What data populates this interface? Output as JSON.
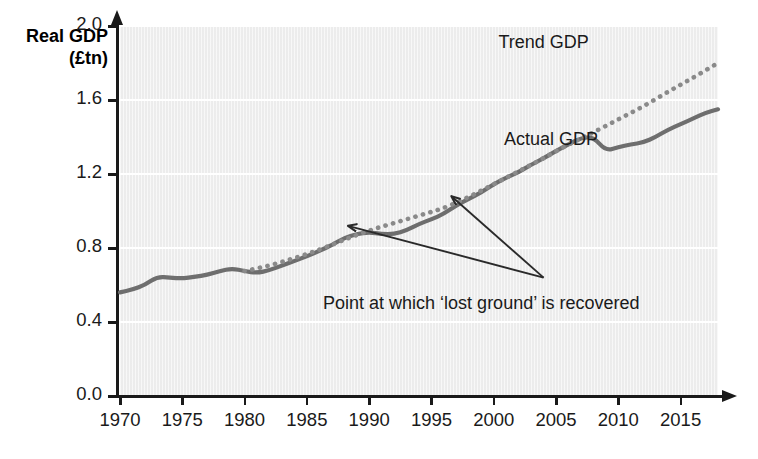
{
  "chart_data": {
    "type": "line",
    "title": "",
    "xlabel": "",
    "ylabel": "Real GDP\n(£tn)",
    "ylabel_line1": "Real GDP",
    "ylabel_line2": "(£tn)",
    "xlim": [
      1970,
      2018
    ],
    "ylim": [
      0.0,
      2.0
    ],
    "grid": true,
    "legend_position": "inline-annotation",
    "yticks": [
      "0.0",
      "0.4",
      "0.8",
      "1.2",
      "1.6",
      "2.0"
    ],
    "ytick_values": [
      0.0,
      0.4,
      0.8,
      1.2,
      1.6,
      2.0
    ],
    "xticks": [
      "1970",
      "1975",
      "1980",
      "1985",
      "1990",
      "1995",
      "2000",
      "2005",
      "2010",
      "2015"
    ],
    "xtick_values": [
      1970,
      1975,
      1980,
      1985,
      1990,
      1995,
      2000,
      2005,
      2010,
      2015
    ],
    "series": [
      {
        "name": "Actual GDP",
        "style": "solid",
        "color": "#6e6e6e",
        "x": [
          1970,
          1971,
          1972,
          1973,
          1974,
          1975,
          1976,
          1977,
          1978,
          1979,
          1980,
          1981,
          1982,
          1983,
          1984,
          1985,
          1986,
          1987,
          1988,
          1989,
          1990,
          1991,
          1992,
          1993,
          1994,
          1995,
          1996,
          1997,
          1998,
          1999,
          2000,
          2001,
          2002,
          2003,
          2004,
          2005,
          2006,
          2007,
          2008,
          2009,
          2010,
          2011,
          2012,
          2013,
          2014,
          2015,
          2016,
          2017,
          2018
        ],
        "values": [
          0.56,
          0.575,
          0.6,
          0.645,
          0.64,
          0.635,
          0.645,
          0.655,
          0.675,
          0.69,
          0.675,
          0.665,
          0.68,
          0.705,
          0.73,
          0.755,
          0.785,
          0.815,
          0.855,
          0.875,
          0.885,
          0.875,
          0.875,
          0.895,
          0.93,
          0.955,
          0.985,
          1.03,
          1.065,
          1.1,
          1.145,
          1.18,
          1.21,
          1.25,
          1.285,
          1.325,
          1.36,
          1.395,
          1.4,
          1.325,
          1.345,
          1.36,
          1.37,
          1.4,
          1.44,
          1.47,
          1.5,
          1.53,
          1.55
        ]
      },
      {
        "name": "Trend GDP",
        "style": "dotted",
        "color": "#8a8a8a",
        "x": [
          1980,
          1982,
          1984,
          1986,
          1988,
          1990,
          1992,
          1994,
          1996,
          1998,
          2000,
          2002,
          2004,
          2006,
          2008,
          2010,
          2012,
          2014,
          2016,
          2018
        ],
        "values": [
          0.675,
          0.705,
          0.745,
          0.79,
          0.845,
          0.895,
          0.935,
          0.975,
          1.015,
          1.075,
          1.145,
          1.215,
          1.285,
          1.36,
          1.425,
          1.495,
          1.565,
          1.645,
          1.72,
          1.8
        ]
      }
    ],
    "annotations": [
      {
        "name": "trend-gdp-label",
        "text": "Trend GDP",
        "x": 2004.0,
        "y": 1.905
      },
      {
        "name": "actual-gdp-label",
        "text": "Actual GDP",
        "x": 2004.6,
        "y": 1.38
      },
      {
        "name": "recovery-note",
        "text": "Point at which ‘lost ground’ is recovered",
        "x": 1999.0,
        "y": 0.49
      }
    ],
    "arrows": [
      {
        "name": "arrow-to-1989-crossing",
        "from_x": 2004.0,
        "from_y": 0.64,
        "to_x": 1988.3,
        "to_y": 0.92
      },
      {
        "name": "arrow-to-1996-crossing",
        "from_x": 2004.0,
        "from_y": 0.64,
        "to_x": 1996.6,
        "to_y": 1.08
      }
    ],
    "colors": {
      "plot_background": "#efefef",
      "gridline": "#ffffff",
      "axis": "#1a1a1a",
      "actual_series": "#6e6e6e",
      "trend_series": "#8a8a8a",
      "text": "#1a1a1a"
    }
  }
}
